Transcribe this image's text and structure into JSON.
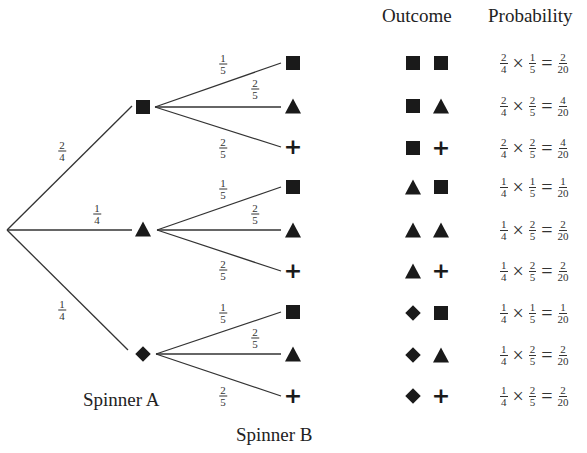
{
  "headers": {
    "outcome": "Outcome",
    "probability": "Probability"
  },
  "labels": {
    "spinner_a": "Spinner A",
    "spinner_b": "Spinner B"
  },
  "symbols": {
    "square": "filled-square",
    "triangle": "filled-triangle",
    "diamond": "filled-diamond",
    "plus": "+"
  },
  "spinner_a_branches": [
    {
      "symbol": "square",
      "prob": {
        "num": "2",
        "den": "4"
      }
    },
    {
      "symbol": "triangle",
      "prob": {
        "num": "1",
        "den": "4"
      }
    },
    {
      "symbol": "diamond",
      "prob": {
        "num": "1",
        "den": "4"
      }
    }
  ],
  "spinner_b_branches": [
    {
      "symbol": "square",
      "prob": {
        "num": "1",
        "den": "5"
      }
    },
    {
      "symbol": "triangle",
      "prob": {
        "num": "2",
        "den": "5"
      }
    },
    {
      "symbol": "plus",
      "prob": {
        "num": "2",
        "den": "5"
      }
    }
  ],
  "operators": {
    "times": "×",
    "equals": "="
  },
  "outcomes": [
    {
      "a": "square",
      "b": "square",
      "pa": {
        "num": "2",
        "den": "4"
      },
      "pb": {
        "num": "1",
        "den": "5"
      },
      "result": {
        "num": "2",
        "den": "20"
      }
    },
    {
      "a": "square",
      "b": "triangle",
      "pa": {
        "num": "2",
        "den": "4"
      },
      "pb": {
        "num": "2",
        "den": "5"
      },
      "result": {
        "num": "4",
        "den": "20"
      }
    },
    {
      "a": "square",
      "b": "plus",
      "pa": {
        "num": "2",
        "den": "4"
      },
      "pb": {
        "num": "2",
        "den": "5"
      },
      "result": {
        "num": "4",
        "den": "20"
      }
    },
    {
      "a": "triangle",
      "b": "square",
      "pa": {
        "num": "1",
        "den": "4"
      },
      "pb": {
        "num": "1",
        "den": "5"
      },
      "result": {
        "num": "1",
        "den": "20"
      }
    },
    {
      "a": "triangle",
      "b": "triangle",
      "pa": {
        "num": "1",
        "den": "4"
      },
      "pb": {
        "num": "2",
        "den": "5"
      },
      "result": {
        "num": "2",
        "den": "20"
      }
    },
    {
      "a": "triangle",
      "b": "plus",
      "pa": {
        "num": "1",
        "den": "4"
      },
      "pb": {
        "num": "2",
        "den": "5"
      },
      "result": {
        "num": "2",
        "den": "20"
      }
    },
    {
      "a": "diamond",
      "b": "square",
      "pa": {
        "num": "1",
        "den": "4"
      },
      "pb": {
        "num": "1",
        "den": "5"
      },
      "result": {
        "num": "1",
        "den": "20"
      }
    },
    {
      "a": "diamond",
      "b": "triangle",
      "pa": {
        "num": "1",
        "den": "4"
      },
      "pb": {
        "num": "2",
        "den": "5"
      },
      "result": {
        "num": "2",
        "den": "20"
      }
    },
    {
      "a": "diamond",
      "b": "plus",
      "pa": {
        "num": "1",
        "den": "4"
      },
      "pb": {
        "num": "2",
        "den": "5"
      },
      "result": {
        "num": "2",
        "den": "20"
      }
    }
  ]
}
